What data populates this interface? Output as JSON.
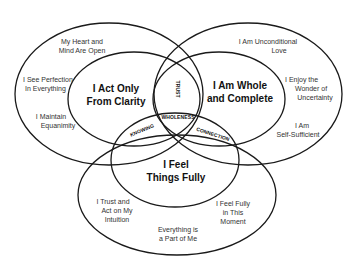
{
  "diagram": {
    "colors": {
      "stroke": "#1a1a1a",
      "background": "#ffffff",
      "text": "#222222"
    },
    "circles": {
      "left": {
        "core": "I Act Only\nFrom Clarity",
        "core_line1": "I Act Only",
        "core_line2": "From Clarity",
        "outer_items": [
          {
            "line1": "My Heart and",
            "line2": "Mind Are Open"
          },
          {
            "line1": "I See Perfection",
            "line2": "In Everything"
          },
          {
            "line1": "I Maintain",
            "line2": "Equanimity"
          }
        ]
      },
      "right": {
        "core_line1": "I Am Whole",
        "core_line2": "and Complete",
        "outer_items": [
          {
            "line1": "I Am Unconditional",
            "line2": "Love"
          },
          {
            "line1": "I Enjoy the",
            "line2": "Wonder of",
            "line3": "Uncertainty"
          },
          {
            "line1": "I Am",
            "line2": "Self-Sufficient"
          }
        ]
      },
      "bottom": {
        "core_line1": "I Feel",
        "core_line2": "Things Fully",
        "outer_items": [
          {
            "line1": "I Trust and",
            "line2": "Act on My",
            "line3": "Intuition"
          },
          {
            "line1": "I Feel Fully",
            "line2": "in This",
            "line3": "Moment"
          },
          {
            "line1": "Everything is",
            "line2": "a Part of Me"
          }
        ]
      }
    },
    "overlaps": {
      "left_right": "TRUST",
      "center": "WHOLENESS",
      "left_bottom": "KNOWING",
      "right_bottom": "CONNECTION"
    }
  }
}
